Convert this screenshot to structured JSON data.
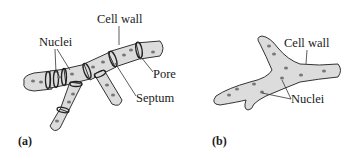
{
  "figure": {
    "panels": [
      {
        "id": "a",
        "label": "(a)",
        "type": "septate hypha",
        "callouts": {
          "cell_wall": "Cell wall",
          "nuclei": "Nuclei",
          "pore": "Pore",
          "septum": "Septum"
        }
      },
      {
        "id": "b",
        "label": "(b)",
        "type": "coenocytic hypha",
        "callouts": {
          "cell_wall": "Cell wall",
          "nuclei": "Nuclei"
        }
      }
    ]
  },
  "colors": {
    "hypha_fill": "#dcdcdc",
    "outline": "#333333",
    "nucleus": "#777777",
    "text": "#1a1a1a"
  }
}
